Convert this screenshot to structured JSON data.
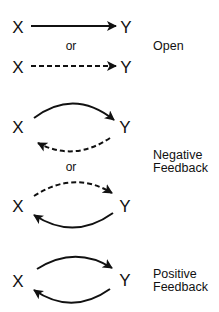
{
  "diagram": {
    "title": "",
    "node_labels": {
      "source": "X",
      "target": "Y"
    },
    "connector_word": "or",
    "panels": [
      {
        "name": "open",
        "category_lines": [
          "Open"
        ],
        "variants": [
          {
            "x_label": "X",
            "y_label": "Y",
            "forward": "solid straight arrow X→Y",
            "backward": null
          },
          {
            "x_label": "X",
            "y_label": "Y",
            "forward": "dashed straight arrow X→Y",
            "backward": null
          }
        ]
      },
      {
        "name": "negative-feedback",
        "category_lines": [
          "Negative",
          "Feedback"
        ],
        "variants": [
          {
            "x_label": "X",
            "y_label": "Y",
            "forward": "solid curved arrow X→Y",
            "backward": "dashed curved arrow Y→X"
          },
          {
            "x_label": "X",
            "y_label": "Y",
            "forward": "dashed curved arrow X→Y",
            "backward": "solid curved arrow Y→X"
          }
        ]
      },
      {
        "name": "positive-feedback",
        "category_lines": [
          "Positive",
          "Feedback"
        ],
        "variants": [
          {
            "x_label": "X",
            "y_label": "Y",
            "forward": "solid curved arrow X→Y",
            "backward": "solid curved arrow Y→X"
          }
        ]
      }
    ],
    "colors": {
      "stroke": "#111111",
      "background": "#ffffff"
    }
  }
}
